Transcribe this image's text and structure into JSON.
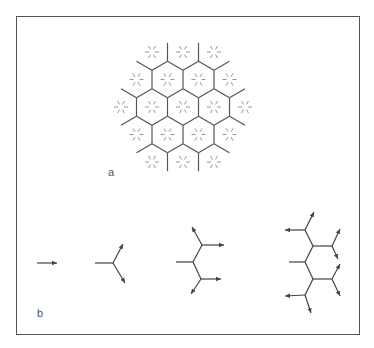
{
  "figure": {
    "panels": [
      {
        "id": "a",
        "label": "a",
        "label_pos": [
          108,
          166
        ]
      },
      {
        "id": "b",
        "label": "b",
        "label_pos": [
          37,
          307
        ]
      }
    ],
    "colors": {
      "frame": "#555555",
      "edge": "#555555",
      "star": "#8a8a8a",
      "arrow": "#444444"
    }
  },
  "hex_grid": {
    "center": [
      183,
      107
    ],
    "col_spacing": 31,
    "row_spacing": 27.5,
    "hex_radius": 18,
    "ring_radius": 2,
    "cell_count": 19,
    "row_counts": [
      3,
      4,
      5,
      4,
      3
    ],
    "star": {
      "rays": 6,
      "inner": 3,
      "outer": 7
    }
  },
  "branching_steps": [
    {
      "name": "step-1-arrow",
      "segments": [
        [
          [
            37,
            263
          ],
          [
            57,
            263
          ],
          1
        ]
      ]
    },
    {
      "name": "step-2-fork",
      "segments": [
        [
          [
            95,
            263
          ],
          [
            113,
            263
          ],
          0
        ],
        [
          [
            113,
            263
          ],
          [
            123,
            244
          ],
          1
        ],
        [
          [
            113,
            263
          ],
          [
            125,
            283
          ],
          1
        ]
      ]
    },
    {
      "name": "step-3-fork",
      "segments": [
        [
          [
            176,
            262
          ],
          [
            193,
            262
          ],
          0
        ],
        [
          [
            193,
            262
          ],
          [
            202,
            245
          ],
          0
        ],
        [
          [
            202,
            245
          ],
          [
            192,
            227
          ],
          1
        ],
        [
          [
            202,
            245
          ],
          [
            224,
            245
          ],
          1
        ],
        [
          [
            193,
            262
          ],
          [
            201,
            279
          ],
          0
        ],
        [
          [
            201,
            279
          ],
          [
            221,
            279
          ],
          1
        ],
        [
          [
            201,
            279
          ],
          [
            191,
            294
          ],
          1
        ]
      ]
    },
    {
      "name": "step-4-fork",
      "segments": [
        [
          [
            289,
            262
          ],
          [
            305,
            262
          ],
          0
        ],
        [
          [
            305,
            262
          ],
          [
            313,
            246
          ],
          0
        ],
        [
          [
            313,
            246
          ],
          [
            305,
            230
          ],
          0
        ],
        [
          [
            305,
            230
          ],
          [
            285,
            230
          ],
          1
        ],
        [
          [
            305,
            230
          ],
          [
            314,
            212
          ],
          1
        ],
        [
          [
            313,
            246
          ],
          [
            332,
            246
          ],
          0
        ],
        [
          [
            332,
            246
          ],
          [
            340,
            229
          ],
          1
        ],
        [
          [
            332,
            246
          ],
          [
            338,
            259
          ],
          1
        ],
        [
          [
            305,
            262
          ],
          [
            313,
            279
          ],
          0
        ],
        [
          [
            313,
            279
          ],
          [
            332,
            279
          ],
          0
        ],
        [
          [
            332,
            279
          ],
          [
            340,
            264
          ],
          1
        ],
        [
          [
            332,
            279
          ],
          [
            340,
            296
          ],
          1
        ],
        [
          [
            313,
            279
          ],
          [
            305,
            295
          ],
          0
        ],
        [
          [
            305,
            295
          ],
          [
            285,
            296
          ],
          1
        ],
        [
          [
            305,
            295
          ],
          [
            311,
            313
          ],
          1
        ]
      ]
    }
  ]
}
